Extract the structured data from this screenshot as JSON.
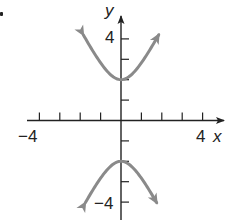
{
  "chart_data": {
    "type": "line",
    "title": "",
    "equation": "y^2/4 - x^2 = 1",
    "xlabel": "x",
    "ylabel": "y",
    "xlim": [
      -4.6,
      5
    ],
    "ylim": [
      -4.8,
      5
    ],
    "x_tick_values": [
      -4,
      -3,
      -2,
      -1,
      1,
      2,
      3,
      4
    ],
    "y_tick_values": [
      -4,
      -3,
      -2,
      -1,
      1,
      2,
      3,
      4
    ],
    "x_tick_labels": [
      {
        "value": -4,
        "text": "−4"
      },
      {
        "value": 4,
        "text": "4"
      }
    ],
    "y_tick_labels": [
      {
        "value": 4,
        "text": "4"
      },
      {
        "value": -4,
        "text": "−4"
      }
    ],
    "grid": false,
    "legend": null,
    "series": [
      {
        "name": "upper branch",
        "color": "#8a8a8a",
        "vertex": [
          0,
          2
        ],
        "x": [
          -1.85,
          -1.5,
          -1.0,
          -0.5,
          0,
          0.5,
          1.0,
          1.5,
          1.85
        ],
        "y": [
          4.2,
          3.61,
          2.83,
          2.24,
          2.0,
          2.24,
          2.83,
          3.61,
          4.2
        ],
        "arrows": "both-ends"
      },
      {
        "name": "lower branch",
        "color": "#8a8a8a",
        "vertex": [
          0,
          -2
        ],
        "x": [
          -1.75,
          -1.5,
          -1.0,
          -0.5,
          0,
          0.5,
          1.0,
          1.5,
          1.75
        ],
        "y": [
          -4.03,
          -3.61,
          -2.83,
          -2.24,
          -2.0,
          -2.24,
          -2.83,
          -3.61,
          -4.03
        ],
        "arrows": "both-ends"
      }
    ]
  },
  "labels": {
    "y_axis": "y",
    "x_axis": "x",
    "y_top_tick": "4",
    "y_bottom_tick": "−4",
    "x_left_tick": "−4",
    "x_right_tick": "4"
  },
  "colors": {
    "axis": "#222222",
    "curve": "#8a8a8a"
  }
}
